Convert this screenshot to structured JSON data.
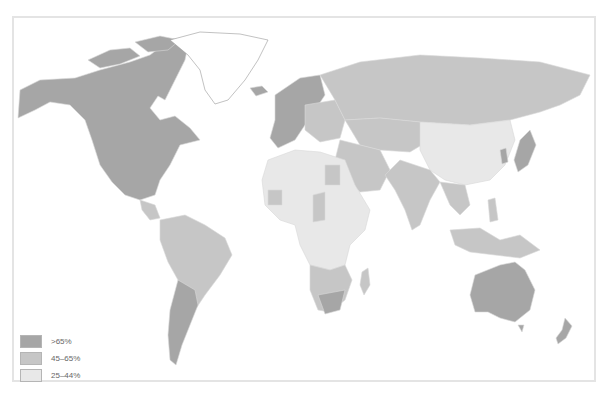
{
  "map": {
    "type": "choropleth",
    "projection": "world",
    "colors": {
      "high": "#a6a6a6",
      "mid": "#c6c6c6",
      "low": "#e8e8e8",
      "nodata": "#ffffff",
      "border": "#d8d8d8"
    }
  },
  "legend": {
    "items": [
      {
        "label": ">65%",
        "color": "#a6a6a6"
      },
      {
        "label": "45–65%",
        "color": "#c6c6c6"
      },
      {
        "label": "25–44%",
        "color": "#e8e8e8"
      }
    ]
  },
  "regions": [
    {
      "name": "North America (Canada, USA, Mexico)",
      "class": ">65%"
    },
    {
      "name": "Greenland",
      "class": "no data"
    },
    {
      "name": "Western Europe",
      "class": ">65%"
    },
    {
      "name": "Russia",
      "class": "45–65%"
    },
    {
      "name": "Central Asia",
      "class": "45–65%"
    },
    {
      "name": "China / Mongolia",
      "class": "25–44%"
    },
    {
      "name": "Japan / South Korea",
      "class": ">65%"
    },
    {
      "name": "India / South Asia",
      "class": "45–65%"
    },
    {
      "name": "Southeast Asia",
      "class": "45–65%"
    },
    {
      "name": "Middle East",
      "class": "45–65%"
    },
    {
      "name": "North & Central Africa",
      "class": "25–44%"
    },
    {
      "name": "Southern Africa",
      "class": "45–65%"
    },
    {
      "name": "South America",
      "class": "45–65%"
    },
    {
      "name": "Argentina / Chile",
      "class": ">65%"
    },
    {
      "name": "Australia / New Zealand",
      "class": ">65%"
    }
  ]
}
